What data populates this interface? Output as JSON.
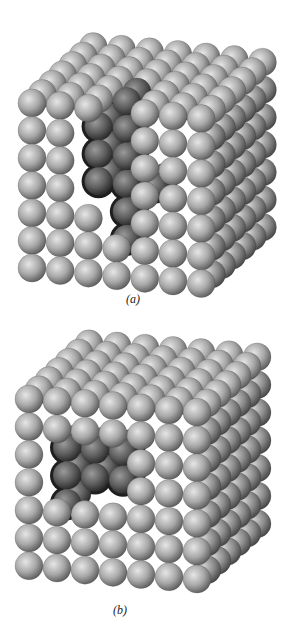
{
  "figure": {
    "background": "#ffffff",
    "sphere_colors": {
      "highlight": "#e6e6e6",
      "mid": "#a8a8a8",
      "shadow": "#5a5a5a",
      "edge": "#3c3c3c"
    },
    "void_color": "#1e1e1e",
    "panels": [
      {
        "id": "a",
        "caption": "(a)",
        "top": 0,
        "height": 310,
        "caption_pos": {
          "x": 126,
          "y": 292
        },
        "description": "Cube of packed spheres with a vacancy cluster cut into the front face",
        "grid": {
          "nx": 7,
          "ny": 7,
          "nz": 7
        },
        "origin": {
          "x": 32,
          "y": 103
        },
        "pitch": {
          "x": 28.2,
          "y": 27.5
        },
        "slope_x": 2.6,
        "depth": {
          "dx": 10.2,
          "dy": -9.4
        },
        "radius": 14,
        "void": {
          "face": "front",
          "cells": [
            [
              3,
              0
            ],
            [
              3,
              1
            ],
            [
              3,
              2
            ],
            [
              3,
              3
            ],
            [
              3,
              4
            ],
            [
              4,
              3
            ],
            [
              2,
              1
            ],
            [
              2,
              2
            ],
            [
              2,
              3
            ],
            [
              3,
              5
            ]
          ],
          "depth": 2
        },
        "missing_front": [
          [
            3,
            0
          ],
          [
            3,
            1
          ],
          [
            3,
            2
          ],
          [
            3,
            3
          ],
          [
            3,
            4
          ],
          [
            2,
            1
          ],
          [
            2,
            2
          ],
          [
            2,
            3
          ]
        ]
      },
      {
        "id": "b",
        "caption": "(b)",
        "top": 310,
        "height": 324,
        "caption_pos": {
          "x": 113,
          "y": 293
        },
        "description": "Cube of packed spheres with an internal cavity exposed on the front face",
        "grid": {
          "nx": 7,
          "ny": 7,
          "nz": 7
        },
        "origin": {
          "x": 29,
          "y": 89
        },
        "pitch": {
          "x": 28.0,
          "y": 27.8
        },
        "slope_x": 2.2,
        "depth": {
          "dx": 10.0,
          "dy": -9.2
        },
        "radius": 14,
        "void": {
          "face": "front",
          "cells": [
            [
              1,
              2
            ],
            [
              2,
              2
            ],
            [
              3,
              2
            ],
            [
              1,
              3
            ],
            [
              2,
              3
            ],
            [
              3,
              3
            ],
            [
              1,
              4
            ]
          ],
          "depth": 2
        },
        "missing_front": [
          [
            1,
            2
          ],
          [
            2,
            2
          ],
          [
            3,
            2
          ],
          [
            1,
            3
          ],
          [
            2,
            3
          ],
          [
            3,
            3
          ]
        ]
      }
    ]
  }
}
